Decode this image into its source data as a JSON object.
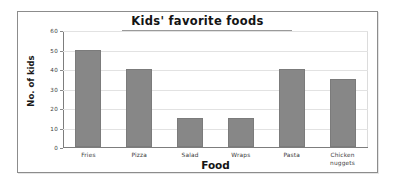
{
  "chart_data": {
    "type": "bar",
    "title": "Kids' favorite foods",
    "xlabel": "Food",
    "ylabel": "No. of kids",
    "categories": [
      "Fries",
      "Pizza",
      "Salad",
      "Wraps",
      "Pasta",
      "Chicken nuggets"
    ],
    "category_lines": [
      [
        "Fries"
      ],
      [
        "Pizza"
      ],
      [
        "Salad"
      ],
      [
        "Wraps"
      ],
      [
        "Pasta"
      ],
      [
        "Chicken",
        "nuggets"
      ]
    ],
    "values": [
      50,
      40,
      15,
      15,
      40,
      35
    ],
    "ylim": [
      0,
      60
    ],
    "ytick_labels": [
      "0",
      "10",
      "20",
      "30",
      "40",
      "50",
      "60"
    ],
    "ytick_values": [
      0,
      10,
      20,
      30,
      40,
      50,
      60
    ],
    "grid": true,
    "legend": false,
    "bar_color": "#878787",
    "background_color": "#ffffff",
    "frame_color": "#8c8c8c"
  }
}
